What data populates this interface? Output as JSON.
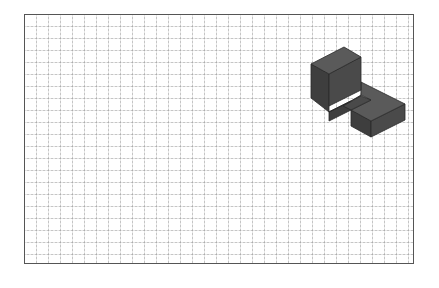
{
  "canvas": {
    "width": 439,
    "height": 288,
    "background": "#ffffff"
  },
  "grid": {
    "cell_size_px": 12,
    "line_style": "dotted",
    "line_color": "#969696",
    "border_color": "#555555"
  },
  "figure": {
    "type": "isometric-solid",
    "colors": {
      "top_face": "#5a5a5a",
      "left_face": "#3e3e3e",
      "right_face": "#4a4a4a",
      "edge": "#2a2a2a"
    }
  }
}
